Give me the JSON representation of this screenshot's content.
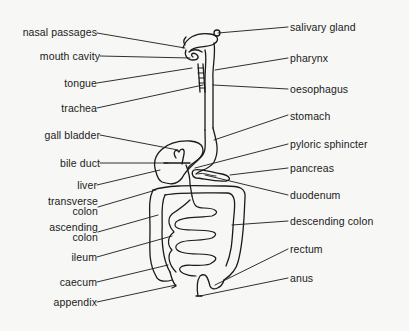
{
  "diagram": {
    "colors": {
      "ink": "#1a1a1a",
      "background": "#f7f7f5"
    },
    "labels_left": [
      {
        "id": "nasal-passages",
        "text": "nasal passages"
      },
      {
        "id": "mouth-cavity",
        "text": "mouth cavity"
      },
      {
        "id": "tongue",
        "text": "tongue"
      },
      {
        "id": "trachea",
        "text": "trachea"
      },
      {
        "id": "gall-bladder",
        "text": "gall bladder"
      },
      {
        "id": "bile-duct",
        "text": "bile duct"
      },
      {
        "id": "liver",
        "text": "liver"
      },
      {
        "id": "transverse-colon",
        "text": "transverse",
        "text2": "colon"
      },
      {
        "id": "ascending-colon",
        "text": "ascending",
        "text2": "colon"
      },
      {
        "id": "ileum",
        "text": "ileum"
      },
      {
        "id": "caecum",
        "text": "caecum"
      },
      {
        "id": "appendix",
        "text": "appendix"
      }
    ],
    "labels_right": [
      {
        "id": "salivary-gland",
        "text": "salivary gland"
      },
      {
        "id": "pharynx",
        "text": "pharynx"
      },
      {
        "id": "oesophagus",
        "text": "oesophagus"
      },
      {
        "id": "stomach",
        "text": "stomach"
      },
      {
        "id": "pyloric-sphincter",
        "text": "pyloric sphincter"
      },
      {
        "id": "pancreas",
        "text": "pancreas"
      },
      {
        "id": "duodenum",
        "text": "duodenum"
      },
      {
        "id": "descending-colon",
        "text": "descending colon"
      },
      {
        "id": "rectum",
        "text": "rectum"
      },
      {
        "id": "anus",
        "text": "anus"
      }
    ]
  }
}
